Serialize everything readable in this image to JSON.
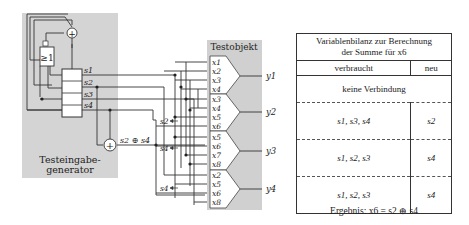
{
  "generator": {
    "label_line1": "Testeingabe-",
    "label_line2": "generator",
    "or_gate": "≥1",
    "xor_symbol": "+",
    "register_outputs": [
      "s1",
      "s2",
      "s3",
      "s4"
    ],
    "xor_output_label": "s2 ⊕ s4"
  },
  "testobject": {
    "title": "Testobjekt",
    "blocks": [
      {
        "inputs": [
          "x1",
          "x2",
          "x3",
          "x4"
        ],
        "output": "y1"
      },
      {
        "inputs": [
          "x3",
          "x4",
          "x5",
          "x6"
        ],
        "output": "y2"
      },
      {
        "inputs": [
          "x5",
          "x6",
          "x7",
          "x8"
        ],
        "output": "y3"
      },
      {
        "inputs": [
          "x2",
          "x5",
          "x6",
          "x8"
        ],
        "output": "y4"
      }
    ],
    "arrow_labels": [
      "s2",
      "s4",
      "s4"
    ]
  },
  "table": {
    "title_line1": "Variablenbilanz zur Berechnung",
    "title_line2": "der Summe für x6",
    "col_used": "verbraucht",
    "col_new": "neu",
    "no_connection": "keine Verbindung",
    "rows": [
      {
        "used": "s1, s3, s4",
        "new": "s2"
      },
      {
        "used": "s1, s2, s3",
        "new": "s4"
      },
      {
        "used": "s1, s2, s3",
        "new": "s4"
      }
    ],
    "result": "Ergebnis: x6 = s2 ⊕ s4"
  }
}
